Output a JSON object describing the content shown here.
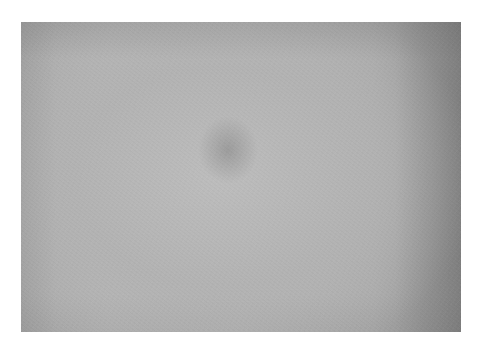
{
  "image": {
    "description": "Flat gray textured surface photograph with soft vignette and a faint darker blotch near upper center",
    "colors": {
      "background": "#ffffff",
      "surface_center": "#b8b8b8",
      "surface_edge": "#8f8f8f",
      "blotch": "#9a9a9a"
    }
  }
}
